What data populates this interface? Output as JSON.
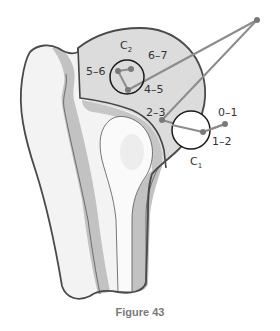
{
  "figure": {
    "caption": "Figure 43",
    "colors": {
      "outline": "#4a4a4a",
      "head_fill": "#dcdcdc",
      "cortex_fill": "#bdbdbd",
      "bone_light": "#f2f2f2",
      "line_gray": "#8c8c8c",
      "point_fill": "#7a7a7a"
    },
    "circles": [
      {
        "id": "C2",
        "label": "C",
        "subscript": "2"
      },
      {
        "id": "C1",
        "label": "C",
        "subscript": "1"
      }
    ],
    "labels": {
      "l_0_1": "0–1",
      "l_1_2": "1–2",
      "l_2_3": "2–3",
      "l_4_5": "4–5",
      "l_5_6": "5–6",
      "l_6_7": "6–7"
    }
  }
}
